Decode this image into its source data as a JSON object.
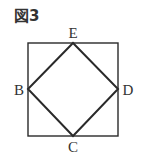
{
  "figure": {
    "title": "図3",
    "labels": {
      "E": "E",
      "B": "B",
      "D": "D",
      "C": "C"
    },
    "outer_square": {
      "x": 28,
      "y": 43,
      "width": 90,
      "height": 93
    },
    "inner_rhombus": {
      "E": [
        73,
        43
      ],
      "D": [
        118,
        89
      ],
      "C": [
        73,
        136
      ],
      "B": [
        28,
        89
      ]
    },
    "colors": {
      "line": "#2a2a2a",
      "text": "#333333",
      "background": "#ffffff"
    }
  }
}
